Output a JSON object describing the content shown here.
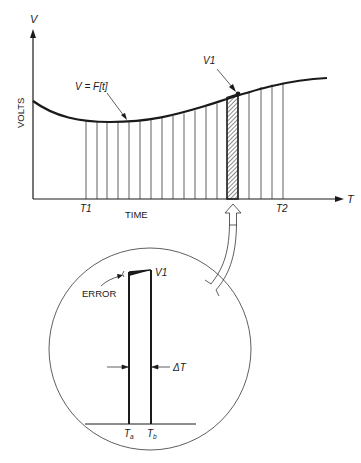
{
  "figure": {
    "y_axis_label": "V",
    "y_axis_title": "VOLTS",
    "x_axis_label": "T",
    "x_axis_title": "TIME",
    "curve_label": "V = F[t]",
    "point_label": "V1",
    "t_start_label": "T1",
    "t_end_label": "T2"
  },
  "inset": {
    "point_label": "V1",
    "error_label": "ERROR",
    "delta_label": "ΔT",
    "ta_label": "T",
    "ta_sub": "a",
    "tb_label": "T",
    "tb_sub": "b"
  },
  "colors": {
    "ink": "#1a1a1a",
    "background": "#ffffff"
  }
}
